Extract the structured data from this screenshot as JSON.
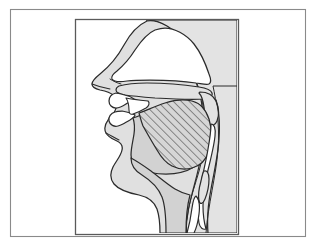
{
  "figure": {
    "title": "Mid-sagittal section of the human vocal tract",
    "caption": "",
    "type": "anatomical-diagram",
    "domain": "phonetics-articulation",
    "canvas": {
      "width": 318,
      "height": 245
    },
    "outer_frame": {
      "x": 10,
      "y": 9,
      "width": 295,
      "height": 227,
      "stroke": "#888888",
      "stroke_width": 1,
      "fill": "#ffffff"
    },
    "inner_panel": {
      "x": 75,
      "y": 19,
      "width": 163,
      "height": 215,
      "stroke": "#555555",
      "stroke_width": 1,
      "fill": "#ffffff"
    },
    "colors": {
      "background": "#ffffff",
      "outer_frame_stroke": "#8a8a8a",
      "inner_frame_stroke": "#5a5a5a",
      "outline_stroke": "#2b2b2b",
      "tissue_fill": "#d2d2d2",
      "head_fill": "#e2e2e2",
      "cavity_fill": "#ffffff",
      "hatch_stroke": "#3a3a3a",
      "hatch_fill": "#d6d6d6"
    },
    "hatching": {
      "angle_degrees": 45,
      "spacing_px": 4,
      "stroke_width": 0.9,
      "region": "tongue-body-raised-back"
    },
    "structures": [
      {
        "name": "head-profile",
        "label": "Head / facial profile",
        "fill": "#e2e2e2"
      },
      {
        "name": "nasal-cavity",
        "label": "Nasal cavity",
        "fill": "#ffffff"
      },
      {
        "name": "hard-palate",
        "label": "Hard palate",
        "fill": "#e2e2e2"
      },
      {
        "name": "velum-uvula",
        "label": "Velum / uvula (soft palate)",
        "fill": "#e2e2e2"
      },
      {
        "name": "upper-teeth",
        "label": "Upper teeth",
        "fill": "#ffffff"
      },
      {
        "name": "lower-teeth",
        "label": "Lower teeth",
        "fill": "#ffffff"
      },
      {
        "name": "upper-lip",
        "label": "Upper lip",
        "fill": "#e2e2e2"
      },
      {
        "name": "lower-lip",
        "label": "Lower lip",
        "fill": "#e2e2e2"
      },
      {
        "name": "tongue-body",
        "label": "Tongue body",
        "fill": "#d2d2d2"
      },
      {
        "name": "tongue-hatched-region",
        "label": "Raised tongue back (hatched)",
        "fill": "hatch"
      },
      {
        "name": "oral-cavity",
        "label": "Oral cavity",
        "fill": "#ffffff"
      },
      {
        "name": "pharyngeal-cavity",
        "label": "Pharyngeal cavity",
        "fill": "#ffffff"
      },
      {
        "name": "pharyngeal-wall",
        "label": "Rear pharyngeal wall",
        "fill": "#e2e2e2"
      },
      {
        "name": "epiglottis",
        "label": "Epiglottis",
        "fill": "#e2e2e2"
      },
      {
        "name": "larynx",
        "label": "Larynx / laryngeal inlet",
        "fill": "#ffffff"
      },
      {
        "name": "neck-jaw",
        "label": "Jaw and neck contour",
        "fill": "#d2d2d2"
      }
    ]
  }
}
